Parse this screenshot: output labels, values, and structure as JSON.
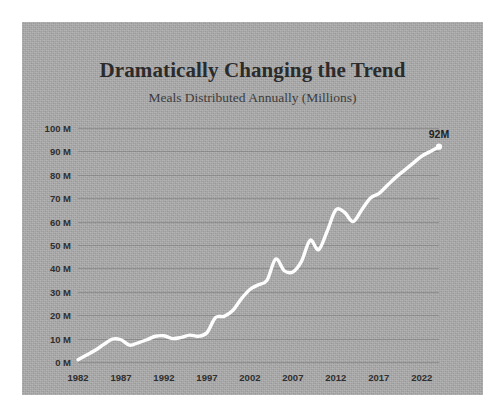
{
  "chart_data": {
    "type": "line",
    "title": "Dramatically Changing the Trend",
    "subtitle": "Meals Distributed Annually (Millions)",
    "xlabel": "",
    "ylabel": "",
    "xlim": [
      1982,
      2024
    ],
    "ylim": [
      0,
      100
    ],
    "grid": true,
    "legend": "none",
    "line_color": "#fdfdfd",
    "background_color": "#aaaaaa",
    "text_color": "#2b2b2b",
    "y_tick_labels": [
      "100 M",
      "90 M",
      "80 M",
      "70 M",
      "60 M",
      "50 M",
      "40 M",
      "30 M",
      "20 M",
      "10 M",
      "0 M"
    ],
    "y_tick_values": [
      100,
      90,
      80,
      70,
      60,
      50,
      40,
      30,
      20,
      10,
      0
    ],
    "x_tick_labels": [
      "1982",
      "1987",
      "1992",
      "1997",
      "2002",
      "2007",
      "2012",
      "2017",
      "2022"
    ],
    "x_tick_values": [
      1982,
      1987,
      1992,
      1997,
      2002,
      2007,
      2012,
      2017,
      2022
    ],
    "annotations": [
      {
        "text": "92M",
        "x": 2024,
        "y": 92
      }
    ],
    "end_point": {
      "x": 2024,
      "y": 92,
      "marker": "dot"
    },
    "x": [
      1982,
      1983,
      1984,
      1985,
      1986,
      1987,
      1988,
      1989,
      1990,
      1991,
      1992,
      1993,
      1994,
      1995,
      1996,
      1997,
      1998,
      1999,
      2000,
      2001,
      2002,
      2003,
      2004,
      2005,
      2006,
      2007,
      2008,
      2009,
      2010,
      2011,
      2012,
      2013,
      2014,
      2015,
      2016,
      2017,
      2018,
      2019,
      2020,
      2021,
      2022,
      2023,
      2024
    ],
    "values": [
      1,
      3,
      5,
      7.5,
      9.8,
      9.5,
      7.2,
      8.2,
      9.5,
      11,
      11.2,
      10,
      10.5,
      11.5,
      11,
      12.5,
      19,
      19.5,
      22,
      27,
      31,
      33,
      35,
      44,
      39,
      38.5,
      43,
      52,
      48,
      56,
      65,
      64,
      60,
      65,
      70,
      72,
      75.5,
      79,
      82,
      85,
      88,
      90,
      92
    ]
  }
}
